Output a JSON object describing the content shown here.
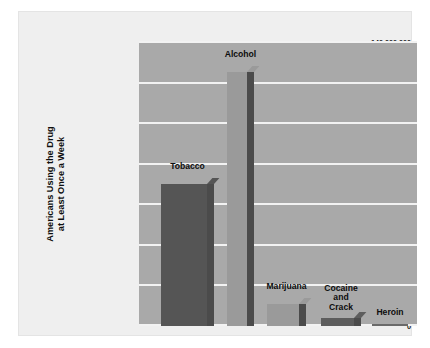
{
  "chart_data": {
    "type": "bar",
    "title": "",
    "xlabel": "",
    "ylabel": "Americans Using the Drug at Least Once a Week",
    "ylabel_lines": [
      "Americans Using the Drug",
      "at Least Once a Week"
    ],
    "categories": [
      "Tobacco",
      "Alcohol",
      "Marijuana",
      "Cocaine and Crack",
      "Heroin"
    ],
    "category_labels": [
      [
        "Tobacco"
      ],
      [
        "Alcohol"
      ],
      [
        "Marijuana"
      ],
      [
        "Cocaine",
        "and",
        "Crack"
      ],
      [
        "Heroin"
      ]
    ],
    "values": [
      70000000,
      125000000,
      11000000,
      4000000,
      1000000
    ],
    "ylim": [
      0,
      140000000
    ],
    "yticks": [
      0,
      20000000,
      40000000,
      60000000,
      80000000,
      100000000,
      120000000,
      140000000
    ],
    "ytick_labels": [
      "0",
      "20,000,000",
      "40,000,000",
      "60,000,000",
      "80,000,000",
      "100,000,000",
      "120,000,000",
      "140,000,000"
    ],
    "grid": true,
    "legend": false,
    "colors": {
      "plot_background": "#a9a9a9",
      "card_background": "#efefef",
      "page_background": "#ffffff",
      "gridline": "#f2f2f2",
      "bar_tobacco": "#555555",
      "bar_alcohol": "#9a9a9a",
      "bar_marijuana": "#9a9a9a",
      "bar_cocaine": "#5d5d5d",
      "bar_heroin": "#6a6a6a",
      "bar_side_shadow": "#4b4b4b",
      "text": "#0d0d0d"
    }
  }
}
